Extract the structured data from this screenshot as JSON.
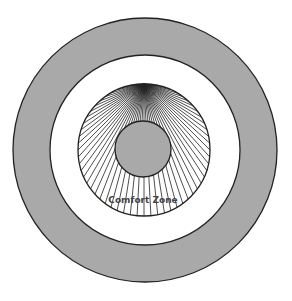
{
  "diagram": {
    "label": "Comfort Zone",
    "colors": {
      "outer_ring": "#a9a9a9",
      "middle_ring": "#ffffff",
      "inner_core": "#a9a9a9",
      "stroke": "#222222",
      "label": "#444444"
    },
    "rings": [
      {
        "name": "outer-ring",
        "cx": 145,
        "cy": 150,
        "r": 132
      },
      {
        "name": "middle-ring",
        "cx": 145,
        "cy": 150,
        "r": 95
      },
      {
        "name": "comfort-zone-ring",
        "cx": 144,
        "cy": 150,
        "r": 66
      },
      {
        "name": "inner-core",
        "cx": 143,
        "cy": 149,
        "r": 28
      }
    ]
  }
}
